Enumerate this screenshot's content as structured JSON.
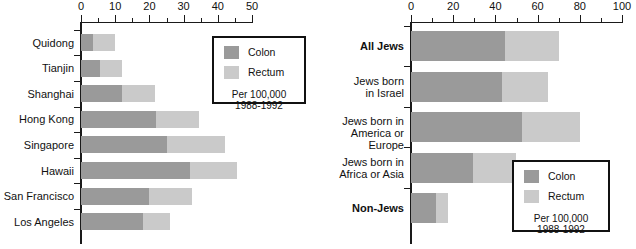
{
  "chart_data": [
    {
      "id": "left",
      "type": "bar",
      "orientation": "horizontal",
      "stacked": true,
      "title": "",
      "xlabel": "",
      "ylabel": "",
      "xlim": [
        0,
        50
      ],
      "xticks": [
        0,
        10,
        20,
        30,
        40,
        50
      ],
      "xtick_labels": [
        "0",
        "10",
        "20",
        "30",
        "40",
        "50"
      ],
      "minor_tick_step": 5,
      "grid": false,
      "categories": [
        "Quidong",
        "Tianjin",
        "Shanghai",
        "Hong Kong",
        "Singapore",
        "Hawaii",
        "San Francisco",
        "Los Angeles"
      ],
      "series": [
        {
          "name": "Colon",
          "color": "#9a9a9a",
          "values": [
            3.5,
            5.5,
            12.0,
            22.0,
            25.0,
            32.0,
            20.0,
            18.0
          ]
        },
        {
          "name": "Rectum",
          "color": "#cacaca",
          "values": [
            6.5,
            6.5,
            9.5,
            12.5,
            17.0,
            13.5,
            12.5,
            8.0
          ]
        }
      ],
      "totals": [
        10.0,
        12.0,
        21.5,
        34.5,
        42.0,
        45.5,
        32.5,
        26.0
      ],
      "legend": {
        "position": "inside-upper-right",
        "entries": [
          {
            "label": "Colon",
            "color": "#9a9a9a"
          },
          {
            "label": "Rectum",
            "color": "#cacaca"
          }
        ],
        "note_line1": "Per 100,000",
        "note_line2": "1988-1992"
      }
    },
    {
      "id": "right",
      "type": "bar",
      "orientation": "horizontal",
      "stacked": true,
      "title": "",
      "xlabel": "",
      "ylabel": "",
      "xlim": [
        0,
        100
      ],
      "xticks": [
        0,
        20,
        40,
        60,
        80,
        100
      ],
      "xtick_labels": [
        "0",
        "20",
        "40",
        "60",
        "80",
        "100"
      ],
      "minor_tick_step": 10,
      "grid": false,
      "categories": [
        "All Jews",
        "Jews born\nin Israel",
        "Jews born in\nAmerica or Europe",
        "Jews born in\nAfrica or Asia",
        "Non-Jews"
      ],
      "categories_bold": [
        true,
        false,
        false,
        false,
        true
      ],
      "series": [
        {
          "name": "Colon",
          "color": "#9a9a9a",
          "values": [
            44.5,
            43.0,
            52.5,
            29.5,
            12.0
          ]
        },
        {
          "name": "Rectum",
          "color": "#cacaca",
          "values": [
            25.5,
            22.0,
            27.5,
            20.5,
            5.5
          ]
        }
      ],
      "totals": [
        70.0,
        65.0,
        80.0,
        50.0,
        17.5
      ],
      "legend": {
        "position": "inside-lower-right",
        "entries": [
          {
            "label": "Colon",
            "color": "#9a9a9a"
          },
          {
            "label": "Rectum",
            "color": "#cacaca"
          }
        ],
        "note_line1": "Per 100,000",
        "note_line2": "1988-1992"
      }
    }
  ],
  "colors": {
    "colon": "#9a9a9a",
    "rectum": "#cacaca",
    "axis": "#1a1a1a",
    "background": "#ffffff"
  }
}
